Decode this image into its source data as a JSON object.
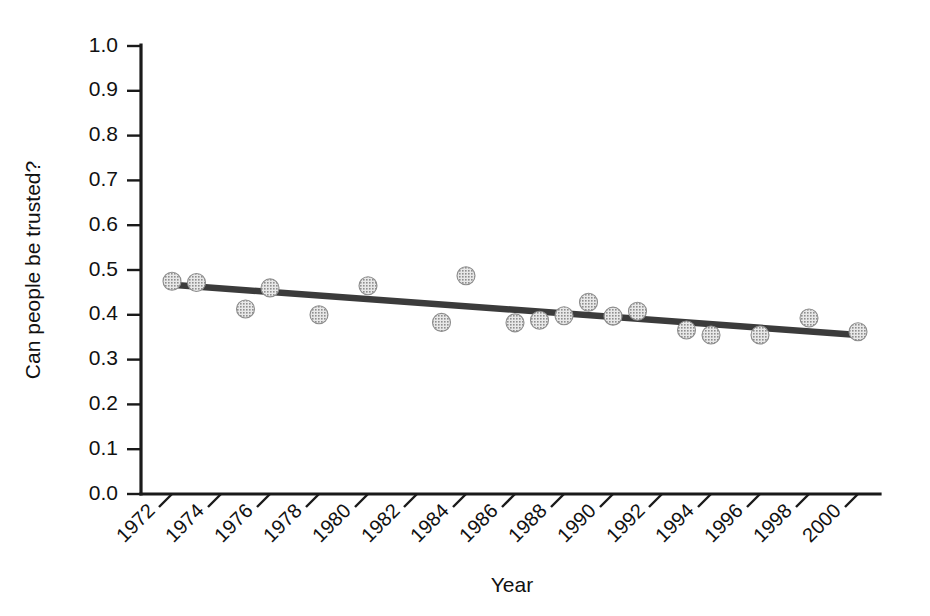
{
  "chart_data": {
    "type": "scatter",
    "title": "",
    "xlabel": "Year",
    "ylabel": "Can people be trusted?",
    "xlim": [
      1971,
      2001
    ],
    "ylim": [
      0.0,
      1.0
    ],
    "grid": false,
    "legend": "none",
    "x_tick_labels": [
      "1972",
      "1974",
      "1976",
      "1978",
      "1980",
      "1982",
      "1984",
      "1986",
      "1988",
      "1990",
      "1992",
      "1994",
      "1996",
      "1998",
      "2000"
    ],
    "x_tick_values": [
      1972,
      1974,
      1976,
      1978,
      1980,
      1982,
      1984,
      1986,
      1988,
      1990,
      1992,
      1994,
      1996,
      1998,
      2000
    ],
    "y_tick_labels": [
      "0.0",
      "0.1",
      "0.2",
      "0.3",
      "0.4",
      "0.5",
      "0.6",
      "0.7",
      "0.8",
      "0.9",
      "1.0"
    ],
    "y_tick_values": [
      0.0,
      0.1,
      0.2,
      0.3,
      0.4,
      0.5,
      0.6,
      0.7,
      0.8,
      0.9,
      1.0
    ],
    "x_tick_rotation": 45,
    "marker_style": "stippled-gray-circle",
    "marker_color": "#a8a8a8",
    "trend_color": "#3b3b3b",
    "series": [
      {
        "name": "Can people be trusted?",
        "x": [
          1972,
          1973,
          1975,
          1976,
          1978,
          1980,
          1983,
          1984,
          1986,
          1987,
          1988,
          1989,
          1990,
          1991,
          1993,
          1994,
          1996,
          1998,
          2000
        ],
        "y": [
          0.475,
          0.472,
          0.413,
          0.46,
          0.4,
          0.465,
          0.383,
          0.487,
          0.382,
          0.388,
          0.398,
          0.428,
          0.397,
          0.408,
          0.366,
          0.355,
          0.355,
          0.393,
          0.362
        ]
      }
    ],
    "trend": {
      "name": "linear fit",
      "x": [
        1972,
        2000
      ],
      "y": [
        0.467,
        0.355
      ]
    }
  },
  "figure": {
    "background": "#ffffff",
    "axis_color": "#1a1a1a"
  }
}
